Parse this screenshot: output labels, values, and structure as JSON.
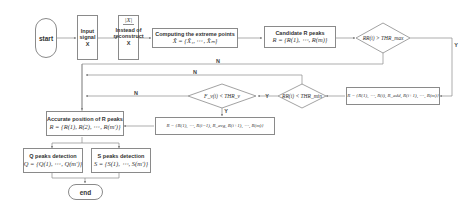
{
  "nodes": {
    "start": {
      "label": "start"
    },
    "input_signal": {
      "label": "Input signal X"
    },
    "instead": {
      "symbol": "|X|",
      "label": "Instead of reconstruct X"
    },
    "extreme_points": {
      "title": "Computing the extreme points",
      "formula": "X̂ = {X̂₁, ⋯, X̂ₘ}"
    },
    "candidate_r": {
      "title": "Candidate R peaks",
      "formula": "R = {R(1), ⋯, R(m)}"
    },
    "decision_rr_max": {
      "label": "RR(i) > THR_max"
    },
    "insert_r": {
      "formula": "R = {R(1), ⋯, R(i), R_add, R(i+1), ⋯, R(m)}"
    },
    "decision_rr_min": {
      "label": "RR(i) < THR_min"
    },
    "decision_fv": {
      "label": "F_v(i) < THR_v"
    },
    "remove_r": {
      "formula": "R = {R(1), ⋯, R(i−1), R_avg, R(i+1), ⋯, R(m)}"
    },
    "accurate_r": {
      "title": "Accurate position of R peaks",
      "formula": "R = {R(1), R(2), ⋯, R(m')}"
    },
    "q_peaks": {
      "title": "Q peaks detection",
      "formula": "Q = {Q(1), ⋯, Q(m')}"
    },
    "s_peaks": {
      "title": "S peaks detection",
      "formula": "S = {S(1), ⋯, S(m')}"
    },
    "end": {
      "label": "end"
    }
  },
  "edge_labels": {
    "rr_max_no": "N",
    "rr_min_no": "N",
    "fv_no": "N",
    "rr_max_yes": "Y",
    "rr_min_yes": "Y",
    "fv_yes": "Y"
  },
  "colors": {
    "line": "#8a8a8a",
    "border": "#8a8a8a",
    "text": "#333333"
  }
}
